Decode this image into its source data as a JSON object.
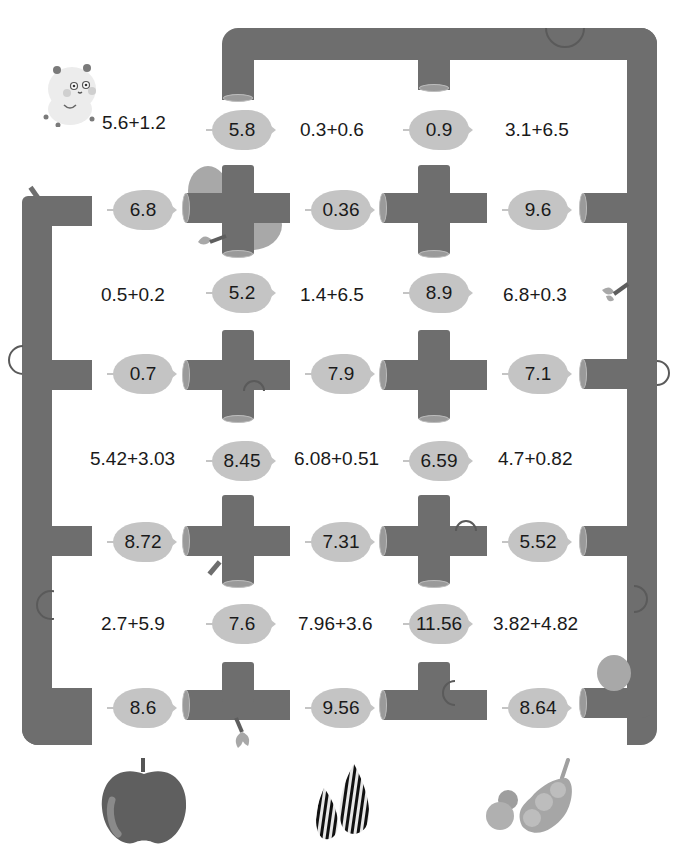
{
  "puzzle": {
    "type": "log-maze-addition",
    "start_character": "hamster",
    "log_color": "#6e6e6e",
    "leaf_color": "#c4c4c4",
    "expressions": [
      {
        "row": 1,
        "col": 1,
        "text": "5.6+1.2"
      },
      {
        "row": 1,
        "col": 2,
        "text": "0.3+0.6"
      },
      {
        "row": 1,
        "col": 3,
        "text": "3.1+6.5"
      },
      {
        "row": 2,
        "col": 1,
        "text": "0.5+0.2"
      },
      {
        "row": 2,
        "col": 2,
        "text": "1.4+6.5"
      },
      {
        "row": 2,
        "col": 3,
        "text": "6.8+0.3"
      },
      {
        "row": 3,
        "col": 1,
        "text": "5.42+3.03"
      },
      {
        "row": 3,
        "col": 2,
        "text": "6.08+0.51"
      },
      {
        "row": 3,
        "col": 3,
        "text": "4.7+0.82"
      },
      {
        "row": 4,
        "col": 1,
        "text": "2.7+5.9"
      },
      {
        "row": 4,
        "col": 2,
        "text": "7.96+3.6"
      },
      {
        "row": 4,
        "col": 3,
        "text": "3.82+4.82"
      }
    ],
    "vertical_leaves": [
      [
        "5.8",
        "0.9"
      ],
      [
        "5.2",
        "8.9"
      ],
      [
        "8.45",
        "6.59"
      ],
      [
        "7.6",
        "11.56"
      ]
    ],
    "horizontal_leaves": [
      [
        "6.8",
        "0.36",
        "9.6"
      ],
      [
        "0.7",
        "7.9",
        "7.1"
      ],
      [
        "8.72",
        "7.31",
        "5.52"
      ],
      [
        "8.6",
        "9.56",
        "8.64"
      ]
    ],
    "destinations": [
      {
        "name": "apple",
        "icon": "apple-icon"
      },
      {
        "name": "sunflower seeds",
        "icon": "sunflower-seeds-icon"
      },
      {
        "name": "peas",
        "icon": "pea-pod-icon"
      }
    ]
  }
}
